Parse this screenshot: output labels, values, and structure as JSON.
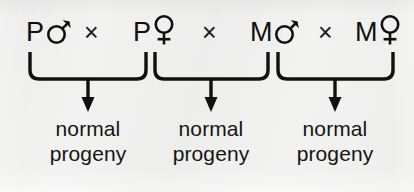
{
  "figure": {
    "background_color": "#f2f2f0",
    "ink_color": "#101010",
    "width": 414,
    "height": 192
  },
  "cross_row": {
    "operator": "×",
    "operator_name": "cross-symbol",
    "tokens": [
      {
        "label": "P",
        "sex": "♂",
        "sex_name": "male-symbol",
        "x": 26
      },
      {
        "label": "P",
        "sex": "♀",
        "sex_name": "female-symbol",
        "x": 133
      },
      {
        "label": "M",
        "sex": "♂",
        "sex_name": "male-symbol",
        "x": 250
      },
      {
        "label": "M",
        "sex": "♀",
        "sex_name": "female-symbol",
        "x": 355
      }
    ],
    "operators": [
      {
        "x": 84
      },
      {
        "x": 202
      },
      {
        "x": 318
      }
    ]
  },
  "crosses": [
    {
      "id": "cross-1",
      "left_parent": "P♂",
      "right_parent": "P♀",
      "brace_left": 30,
      "brace_right": 146,
      "arrow_x": 88,
      "result_line1": "normal",
      "result_line2": "progeny",
      "label_x": 88
    },
    {
      "id": "cross-2",
      "left_parent": "P♀",
      "right_parent": "M♂",
      "brace_left": 155,
      "brace_right": 268,
      "arrow_x": 211,
      "result_line1": "normal",
      "result_line2": "progeny",
      "label_x": 211
    },
    {
      "id": "cross-3",
      "left_parent": "M♂",
      "right_parent": "M♀",
      "brace_left": 278,
      "brace_right": 393,
      "arrow_x": 335,
      "result_line1": "normal",
      "result_line2": "progeny",
      "label_x": 335
    }
  ],
  "geometry": {
    "brace_top_y": 52,
    "brace_bottom_y": 79,
    "arrow_tip_y": 112,
    "corner_radius": 9,
    "stroke_width": 3.4,
    "label_top_y": 116
  }
}
